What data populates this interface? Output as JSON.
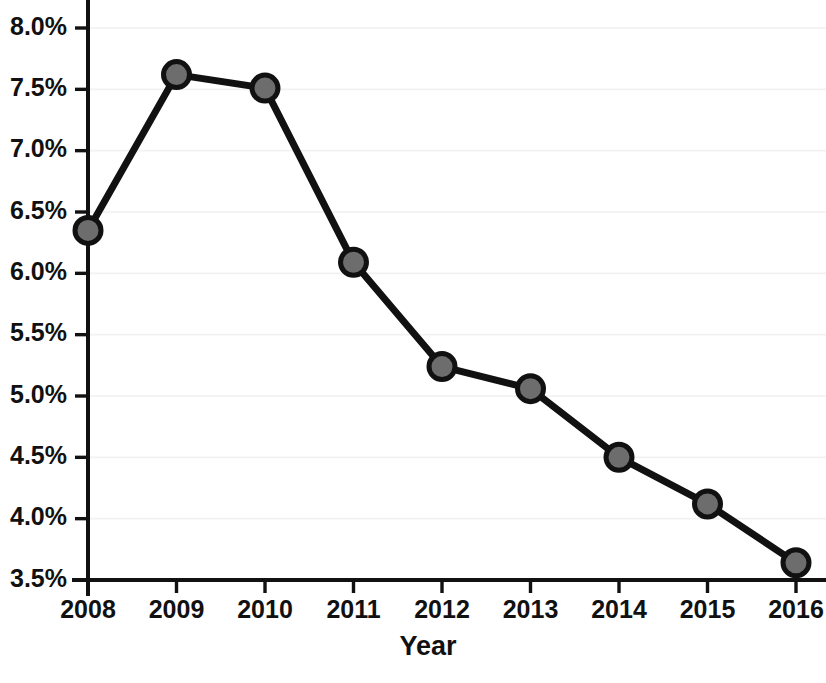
{
  "chart_data": {
    "type": "line",
    "title": "",
    "subtitle": "",
    "xlabel": "Year",
    "ylabel": "",
    "categories": [
      "2008",
      "2009",
      "2010",
      "2011",
      "2012",
      "2013",
      "2014",
      "2015",
      "2016"
    ],
    "x": [
      2008,
      2009,
      2010,
      2011,
      2012,
      2013,
      2014,
      2015,
      2016
    ],
    "values": [
      6.35,
      7.62,
      7.51,
      6.09,
      5.24,
      5.06,
      4.5,
      4.12,
      3.64
    ],
    "series": [
      {
        "name": "",
        "values": [
          6.35,
          7.62,
          7.51,
          6.09,
          5.24,
          5.06,
          4.5,
          4.12,
          3.64
        ]
      }
    ],
    "xlim": [
      2008,
      2016
    ],
    "ylim": [
      3.5,
      8.0
    ],
    "ytick_values": [
      3.5,
      4.0,
      4.5,
      5.0,
      5.5,
      6.0,
      6.5,
      7.0,
      7.5,
      8.0
    ],
    "ytick_labels": [
      "3.5%",
      "4.0%",
      "4.5%",
      "5.0%",
      "5.5%",
      "6.0%",
      "6.5%",
      "7.0%",
      "7.5%",
      "8.0%"
    ],
    "xtick_labels": [
      "2008",
      "2009",
      "2010",
      "2011",
      "2012",
      "2013",
      "2014",
      "2015",
      "2016"
    ],
    "grid": true,
    "grid_axis": "y",
    "legend": false,
    "legend_position": "none",
    "annotations": [],
    "colors": {
      "line": "#111111",
      "marker_fill": "#6d6d6d",
      "marker_edge": "#111111",
      "grid": "#f1f1f1",
      "axis": "#111111",
      "background": "#ffffff",
      "text": "#111111"
    }
  },
  "layout": {
    "plot_left": 88,
    "plot_right": 796,
    "plot_top": 28,
    "plot_bottom": 580,
    "tick_length": 13,
    "marker_radius": 13
  }
}
